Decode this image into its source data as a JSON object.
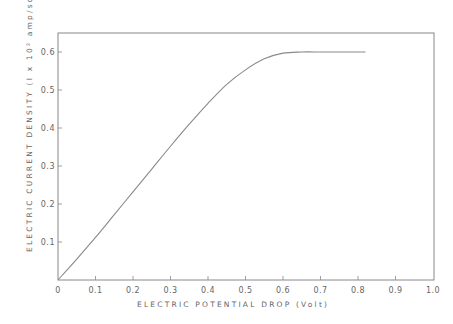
{
  "chart_data": {
    "type": "line",
    "title": "",
    "xlabel": "ELECTRIC POTENTIAL DROP (Volt)",
    "ylabel": "ELECTRIC CURRENT DENSITY (I x 10² amp/sq.cm)",
    "xlim": [
      0,
      1.0
    ],
    "ylim": [
      0,
      0.65
    ],
    "grid": false,
    "legend": null,
    "x_ticks": [
      "0",
      "0.1",
      "0.2",
      "0.3",
      "0.4",
      "0.5",
      "0.6",
      "0.7",
      "0.8",
      "0.9",
      "1.0"
    ],
    "y_ticks": [
      "0.1",
      "0.2",
      "0.3",
      "0.4",
      "0.5",
      "0.6"
    ],
    "series": [
      {
        "name": "current density",
        "x": [
          0,
          0.05,
          0.1,
          0.15,
          0.2,
          0.25,
          0.3,
          0.35,
          0.4,
          0.45,
          0.5,
          0.55,
          0.6,
          0.65,
          0.7,
          0.75,
          0.82
        ],
        "y": [
          0,
          0.055,
          0.112,
          0.172,
          0.232,
          0.292,
          0.352,
          0.41,
          0.465,
          0.515,
          0.553,
          0.582,
          0.597,
          0.6,
          0.6,
          0.6,
          0.6
        ]
      }
    ]
  }
}
